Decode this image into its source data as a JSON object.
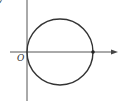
{
  "diagram": {
    "type": "coordinate-plane-circle",
    "labels": {
      "origin": "O",
      "y_axis_partial": "y"
    },
    "colors": {
      "stroke": "#333333",
      "axis": "#555555",
      "background": "#ffffff"
    },
    "geometry": {
      "y_axis_x": 27,
      "x_axis_y": 52,
      "circle_center": [
        60,
        52
      ],
      "circle_radius": 33,
      "marked_point": [
        93,
        52
      ]
    }
  }
}
